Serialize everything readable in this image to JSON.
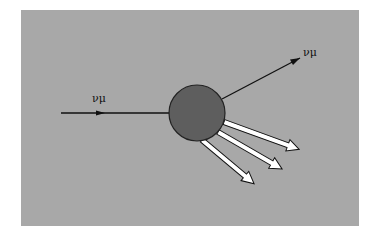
{
  "diagram": {
    "incoming_label": "νμ",
    "outgoing_label": "νμ",
    "colors": {
      "background": "#a8a8a8",
      "target": "#5e5e5e",
      "lines": "#111111",
      "hadron_arrows": "#ffffff"
    },
    "hadron_arrow_count": 3
  }
}
